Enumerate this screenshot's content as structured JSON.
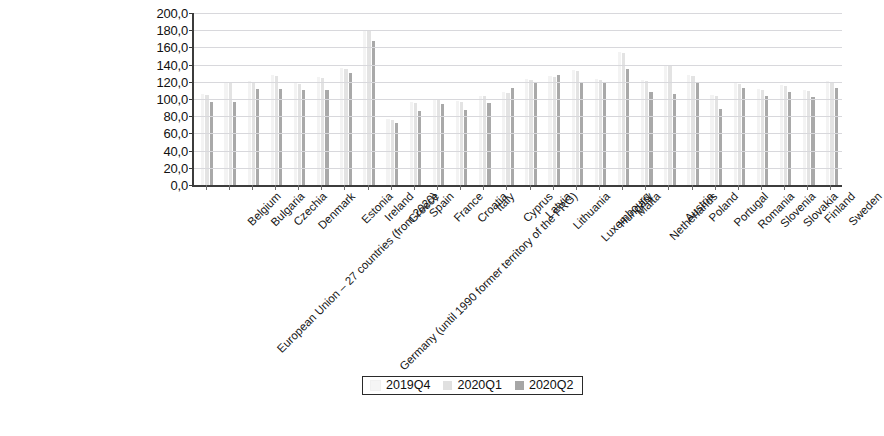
{
  "chart_data": {
    "type": "bar",
    "title": "",
    "subtitle": "",
    "xlabel": "",
    "ylabel": "",
    "ylim": [
      0,
      200
    ],
    "ytick_labels": [
      "200,0",
      "180,0",
      "160,0",
      "140,0",
      "120,0",
      "100,0",
      "80,0",
      "60,0",
      "40,0",
      "20,0",
      "0,0"
    ],
    "ytick_values": [
      200,
      180,
      160,
      140,
      120,
      100,
      80,
      60,
      40,
      20,
      0
    ],
    "grid": true,
    "legend_position": "bottom",
    "decimal_separator": ",",
    "categories": [
      "European Union – 27 countries (from 2020)",
      "Belgium",
      "Bulgaria",
      "Czechia",
      "Denmark",
      "Germany (until 1990 former territory of the FRG)",
      "Estonia",
      "Ireland",
      "Greece",
      "Spain",
      "France",
      "Croatia",
      "Italy",
      "Cyprus",
      "Latvia",
      "Lithuania",
      "Luxembourg",
      "Hungary",
      "Malta",
      "Netherlands",
      "Austria",
      "Poland",
      "Portugal",
      "Romania",
      "Slovenia",
      "Slovakia",
      "Finland",
      "Sweden"
    ],
    "series": [
      {
        "name": "2019Q4",
        "color": "#f3f3f3",
        "values": [
          106.0,
          120.0,
          121.0,
          128.0,
          119.0,
          126.0,
          136.0,
          180.0,
          77.0,
          96.0,
          100.0,
          98.0,
          104.0,
          108.0,
          123.0,
          127.0,
          134.0,
          123.0,
          155.0,
          122.0,
          139.0,
          128.0,
          105.0,
          119.0,
          112.0,
          116.0,
          110.0,
          121.0
        ]
      },
      {
        "name": "2020Q1",
        "color": "#e3e3e3",
        "values": [
          105.0,
          119.0,
          120.0,
          127.0,
          118.0,
          125.0,
          135.0,
          179.0,
          76.0,
          95.0,
          99.0,
          97.0,
          103.0,
          107.0,
          122.0,
          126.0,
          133.0,
          122.0,
          154.0,
          121.0,
          138.0,
          127.0,
          104.0,
          118.0,
          111.0,
          115.0,
          109.0,
          120.0
        ]
      },
      {
        "name": "2020Q2",
        "color": "#a9a9a9",
        "values": [
          97.0,
          97.0,
          112.0,
          112.0,
          110.0,
          110.0,
          130.0,
          168.0,
          72.0,
          86.0,
          94.0,
          87.0,
          95.0,
          113.0,
          120.0,
          128.0,
          120.0,
          120.0,
          135.0,
          108.0,
          106.0,
          120.0,
          88.0,
          113.0,
          104.0,
          108.0,
          102.0,
          113.0
        ]
      }
    ]
  },
  "legend": {
    "items": [
      {
        "label": "2019Q4",
        "swatch": "legend-swatch-2019q4"
      },
      {
        "label": "2020Q1",
        "swatch": "legend-swatch-2020q1"
      },
      {
        "label": "2020Q2",
        "swatch": "legend-swatch-2020q2"
      }
    ]
  }
}
